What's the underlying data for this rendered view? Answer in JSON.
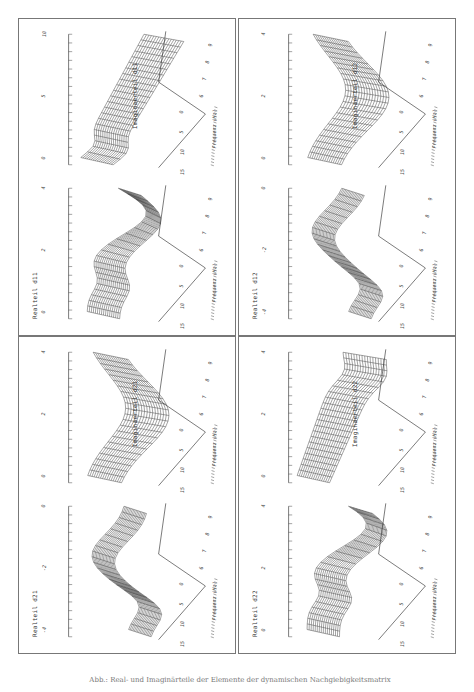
{
  "caption": "Abb.: Real- und Imaginärteile der Elemente der dynamischen Nachgiebigkeitsmatrix",
  "panels": [
    {
      "id": "d11",
      "real_label": "Realteil d11",
      "imag_label": "Imaginaerteil d11",
      "real_z_ticks": [
        "4",
        "2",
        "0"
      ],
      "imag_z_ticks": [
        "10",
        "5",
        "0"
      ]
    },
    {
      "id": "d12",
      "real_label": "Realteil d12",
      "imag_label": "Imaginaerteil d12",
      "real_z_ticks": [
        "0",
        "-2",
        "-4"
      ],
      "imag_z_ticks": [
        "4",
        "2",
        "0"
      ]
    },
    {
      "id": "d21",
      "real_label": "Realteil d21",
      "imag_label": "Imaginaerteil d21",
      "real_z_ticks": [
        "0",
        "-2",
        "-4"
      ],
      "imag_z_ticks": [
        "4",
        "2",
        "0"
      ]
    },
    {
      "id": "d22",
      "real_label": "Realteil d22",
      "imag_label": "Imaginaerteil d22",
      "real_z_ticks": [
        "4",
        "2",
        "0"
      ],
      "imag_z_ticks": [
        "4",
        "2",
        "0"
      ]
    }
  ],
  "axes": {
    "freq_label": "Frequenz (Hz)",
    "freq_ticks": [
      "15",
      "10",
      "5",
      "0"
    ],
    "depth_ticks": [
      "6",
      "7",
      "8",
      "9"
    ]
  },
  "chart_data": [
    {
      "type": "surface",
      "title": "Realteil d11",
      "xlabel": "Frequenz (Hz)",
      "x_ticks": [
        15,
        10,
        5,
        0
      ],
      "y_ticks": [
        6,
        7,
        8,
        9
      ],
      "z_ticks": [
        0,
        2,
        4
      ]
    },
    {
      "type": "surface",
      "title": "Imaginaerteil d11",
      "xlabel": "Frequenz (Hz)",
      "x_ticks": [
        15,
        10,
        5,
        0
      ],
      "y_ticks": [
        6,
        7,
        8,
        9
      ],
      "z_ticks": [
        0,
        5,
        10
      ]
    },
    {
      "type": "surface",
      "title": "Realteil d12",
      "xlabel": "Frequenz (Hz)",
      "x_ticks": [
        15,
        10,
        5,
        0
      ],
      "y_ticks": [
        6,
        7,
        8,
        9
      ],
      "z_ticks": [
        -4,
        -2,
        0
      ]
    },
    {
      "type": "surface",
      "title": "Imaginaerteil d12",
      "xlabel": "Frequenz (Hz)",
      "x_ticks": [
        15,
        10,
        5,
        0
      ],
      "y_ticks": [
        6,
        7,
        8,
        9
      ],
      "z_ticks": [
        0,
        2,
        4
      ]
    },
    {
      "type": "surface",
      "title": "Realteil d21",
      "xlabel": "Frequenz (Hz)",
      "x_ticks": [
        15,
        10,
        5,
        0
      ],
      "y_ticks": [
        6,
        7,
        8,
        9
      ],
      "z_ticks": [
        -4,
        -2,
        0
      ]
    },
    {
      "type": "surface",
      "title": "Imaginaerteil d21",
      "xlabel": "Frequenz (Hz)",
      "x_ticks": [
        15,
        10,
        5,
        0
      ],
      "y_ticks": [
        6,
        7,
        8,
        9
      ],
      "z_ticks": [
        0,
        2,
        4
      ]
    },
    {
      "type": "surface",
      "title": "Realteil d22",
      "xlabel": "Frequenz (Hz)",
      "x_ticks": [
        15,
        10,
        5,
        0
      ],
      "y_ticks": [
        6,
        7,
        8,
        9
      ],
      "z_ticks": [
        0,
        2,
        4
      ]
    },
    {
      "type": "surface",
      "title": "Imaginaerteil d22",
      "xlabel": "Frequenz (Hz)",
      "x_ticks": [
        15,
        10,
        5,
        0
      ],
      "y_ticks": [
        6,
        7,
        8,
        9
      ],
      "z_ticks": [
        0,
        2,
        4
      ]
    }
  ]
}
